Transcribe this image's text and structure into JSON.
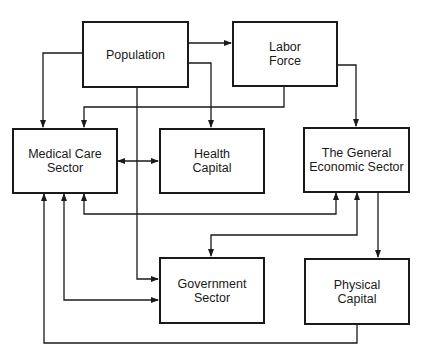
{
  "diagram": {
    "nodes": {
      "population": {
        "label": "Population"
      },
      "labor_force": {
        "label": "Labor\nForce"
      },
      "medical_care_sector": {
        "label": "Medical Care\nSector"
      },
      "health_capital": {
        "label": "Health\nCapital"
      },
      "general_economic_sector": {
        "label": "The General\nEconomic Sector"
      },
      "government_sector": {
        "label": "Government\nSector"
      },
      "physical_capital": {
        "label": "Physical\nCapital"
      }
    },
    "edges": [
      {
        "from": "Population",
        "to": "Medical Care Sector",
        "direction": "one-way"
      },
      {
        "from": "Population",
        "to": "Labor Force",
        "direction": "one-way"
      },
      {
        "from": "Population",
        "to": "Health Capital",
        "direction": "one-way"
      },
      {
        "from": "Population",
        "to": "Government Sector",
        "direction": "one-way"
      },
      {
        "from": "Labor Force",
        "to": "Medical Care Sector",
        "direction": "one-way"
      },
      {
        "from": "Labor Force",
        "to": "The General Economic Sector",
        "direction": "one-way"
      },
      {
        "from": "Medical Care Sector",
        "to": "Health Capital",
        "direction": "two-way"
      },
      {
        "from": "Medical Care Sector",
        "to": "The General Economic Sector",
        "direction": "two-way"
      },
      {
        "from": "Medical Care Sector",
        "to": "Government Sector",
        "direction": "two-way"
      },
      {
        "from": "The General Economic Sector",
        "to": "Government Sector",
        "direction": "two-way"
      },
      {
        "from": "The General Economic Sector",
        "to": "Physical Capital",
        "direction": "one-way"
      },
      {
        "from": "Physical Capital",
        "to": "Medical Care Sector",
        "direction": "one-way"
      }
    ],
    "colors": {
      "line": "#1a1a1a",
      "background": "#ffffff"
    }
  }
}
